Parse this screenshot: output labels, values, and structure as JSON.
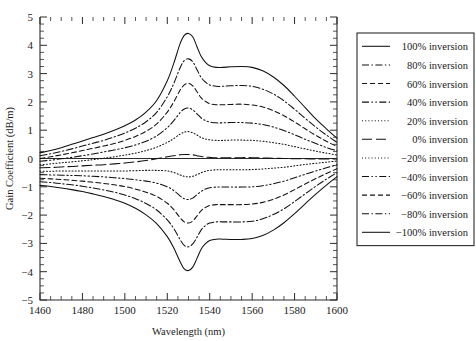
{
  "chart_data": {
    "type": "line",
    "title": "",
    "xlabel": "Wavelength (nm)",
    "ylabel": "Gain Coefficient (dB/m)",
    "xlim": [
      1460,
      1600
    ],
    "ylim": [
      -5,
      5
    ],
    "xticks": [
      1460,
      1480,
      1500,
      1520,
      1540,
      1560,
      1580,
      1600
    ],
    "xtick_labels": [
      "1460",
      "1480",
      "1500",
      "1520",
      "1540",
      "1560",
      "1580",
      "1600"
    ],
    "yticks": [
      -5,
      -4,
      -3,
      -2,
      -1,
      0,
      1,
      2,
      3,
      4,
      5
    ],
    "ytick_labels": [
      "−5",
      "−4",
      "−3",
      "−2",
      "−1",
      "0",
      "1",
      "2",
      "3",
      "4",
      "5"
    ],
    "x_minor_tick_step": 5,
    "y_minor_tick_step": 0.25,
    "grid": false,
    "legend_position": "right-outside",
    "zero_reference_line": true,
    "x": [
      1460,
      1465,
      1470,
      1475,
      1480,
      1485,
      1490,
      1495,
      1500,
      1505,
      1510,
      1515,
      1520,
      1523,
      1526,
      1528,
      1530,
      1532,
      1534,
      1536,
      1538,
      1540,
      1543,
      1546,
      1550,
      1555,
      1560,
      1565,
      1570,
      1575,
      1580,
      1585,
      1590,
      1595,
      1600
    ],
    "series": [
      {
        "name": "100% inversion",
        "inversion_percent": 100,
        "style": "solid",
        "values": [
          0.2,
          0.28,
          0.38,
          0.5,
          0.62,
          0.74,
          0.86,
          1.0,
          1.16,
          1.36,
          1.64,
          2.05,
          2.75,
          3.35,
          4.05,
          4.35,
          4.42,
          4.3,
          3.95,
          3.6,
          3.4,
          3.28,
          3.22,
          3.22,
          3.24,
          3.25,
          3.22,
          3.1,
          2.88,
          2.58,
          2.2,
          1.8,
          1.4,
          1.05,
          0.72
        ]
      },
      {
        "name": "80% inversion",
        "inversion_percent": 80,
        "style": "dash-dot",
        "values": [
          0.1,
          0.17,
          0.25,
          0.34,
          0.44,
          0.54,
          0.64,
          0.76,
          0.9,
          1.07,
          1.3,
          1.63,
          2.18,
          2.64,
          3.2,
          3.46,
          3.52,
          3.42,
          3.14,
          2.86,
          2.7,
          2.6,
          2.55,
          2.55,
          2.57,
          2.58,
          2.55,
          2.45,
          2.28,
          2.04,
          1.74,
          1.42,
          1.11,
          0.83,
          0.57
        ]
      },
      {
        "name": "60% inversion",
        "inversion_percent": 60,
        "style": "dashed",
        "values": [
          0.0,
          0.06,
          0.13,
          0.2,
          0.28,
          0.36,
          0.44,
          0.53,
          0.64,
          0.78,
          0.96,
          1.22,
          1.64,
          1.99,
          2.41,
          2.6,
          2.65,
          2.57,
          2.36,
          2.14,
          2.02,
          1.94,
          1.9,
          1.9,
          1.91,
          1.92,
          1.89,
          1.82,
          1.69,
          1.51,
          1.29,
          1.05,
          0.82,
          0.61,
          0.42
        ]
      },
      {
        "name": "40% inversion",
        "inversion_percent": 40,
        "style": "dash-dot-dot",
        "values": [
          -0.1,
          -0.06,
          -0.01,
          0.04,
          0.1,
          0.16,
          0.23,
          0.3,
          0.38,
          0.48,
          0.61,
          0.8,
          1.09,
          1.33,
          1.62,
          1.75,
          1.78,
          1.72,
          1.58,
          1.43,
          1.34,
          1.29,
          1.26,
          1.26,
          1.27,
          1.27,
          1.25,
          1.2,
          1.11,
          0.99,
          0.84,
          0.68,
          0.53,
          0.39,
          0.27
        ]
      },
      {
        "name": "20% inversion",
        "inversion_percent": 20,
        "style": "dotted",
        "values": [
          -0.22,
          -0.19,
          -0.15,
          -0.12,
          -0.08,
          -0.04,
          0.01,
          0.06,
          0.12,
          0.19,
          0.28,
          0.4,
          0.57,
          0.7,
          0.86,
          0.93,
          0.95,
          0.91,
          0.83,
          0.74,
          0.69,
          0.66,
          0.64,
          0.64,
          0.65,
          0.65,
          0.64,
          0.61,
          0.56,
          0.5,
          0.42,
          0.34,
          0.26,
          0.19,
          0.12
        ]
      },
      {
        "name": "0% inversion",
        "inversion_percent": 0,
        "style": "long-dash",
        "values": [
          -0.33,
          -0.32,
          -0.3,
          -0.28,
          -0.26,
          -0.24,
          -0.22,
          -0.19,
          -0.16,
          -0.12,
          -0.07,
          -0.01,
          0.06,
          0.1,
          0.13,
          0.14,
          0.14,
          0.13,
          0.1,
          0.07,
          0.05,
          0.04,
          0.03,
          0.03,
          0.03,
          0.03,
          0.03,
          0.02,
          0.01,
          0.0,
          -0.01,
          -0.01,
          -0.02,
          -0.02,
          -0.02
        ]
      },
      {
        "name": "−20% inversion",
        "inversion_percent": -20,
        "style": "dotted",
        "values": [
          -0.45,
          -0.45,
          -0.44,
          -0.44,
          -0.44,
          -0.44,
          -0.44,
          -0.44,
          -0.44,
          -0.43,
          -0.42,
          -0.42,
          -0.44,
          -0.49,
          -0.58,
          -0.63,
          -0.65,
          -0.63,
          -0.57,
          -0.5,
          -0.45,
          -0.42,
          -0.4,
          -0.4,
          -0.4,
          -0.4,
          -0.39,
          -0.37,
          -0.34,
          -0.31,
          -0.26,
          -0.21,
          -0.17,
          -0.13,
          -0.09
        ]
      },
      {
        "name": "−40% inversion",
        "inversion_percent": -40,
        "style": "dash-dot-dot",
        "values": [
          -0.57,
          -0.58,
          -0.59,
          -0.6,
          -0.61,
          -0.63,
          -0.65,
          -0.68,
          -0.71,
          -0.75,
          -0.8,
          -0.87,
          -1.0,
          -1.13,
          -1.32,
          -1.42,
          -1.45,
          -1.4,
          -1.28,
          -1.16,
          -1.08,
          -1.03,
          -1.01,
          -1.01,
          -1.01,
          -1.01,
          -1.0,
          -0.96,
          -0.89,
          -0.8,
          -0.68,
          -0.56,
          -0.44,
          -0.33,
          -0.22
        ]
      },
      {
        "name": "−60% inversion",
        "inversion_percent": -60,
        "style": "dashed",
        "values": [
          -0.7,
          -0.72,
          -0.74,
          -0.77,
          -0.8,
          -0.84,
          -0.88,
          -0.93,
          -0.99,
          -1.08,
          -1.19,
          -1.34,
          -1.58,
          -1.8,
          -2.09,
          -2.24,
          -2.28,
          -2.21,
          -2.03,
          -1.84,
          -1.73,
          -1.66,
          -1.63,
          -1.63,
          -1.63,
          -1.63,
          -1.61,
          -1.55,
          -1.44,
          -1.29,
          -1.1,
          -0.9,
          -0.71,
          -0.53,
          -0.36
        ]
      },
      {
        "name": "−80% inversion",
        "inversion_percent": -80,
        "style": "dash-dot",
        "values": [
          -0.82,
          -0.85,
          -0.89,
          -0.93,
          -0.98,
          -1.04,
          -1.11,
          -1.19,
          -1.29,
          -1.42,
          -1.59,
          -1.82,
          -2.17,
          -2.47,
          -2.86,
          -3.07,
          -3.12,
          -3.02,
          -2.78,
          -2.52,
          -2.37,
          -2.28,
          -2.24,
          -2.24,
          -2.24,
          -2.24,
          -2.22,
          -2.13,
          -1.98,
          -1.78,
          -1.52,
          -1.25,
          -0.98,
          -0.73,
          -0.5
        ]
      },
      {
        "name": "−100% inversion",
        "inversion_percent": -100,
        "style": "solid",
        "values": [
          -0.95,
          -0.99,
          -1.04,
          -1.1,
          -1.17,
          -1.25,
          -1.34,
          -1.45,
          -1.58,
          -1.76,
          -1.99,
          -2.3,
          -2.76,
          -3.15,
          -3.64,
          -3.9,
          -3.96,
          -3.84,
          -3.53,
          -3.2,
          -3.01,
          -2.9,
          -2.85,
          -2.85,
          -2.86,
          -2.86,
          -2.83,
          -2.72,
          -2.53,
          -2.27,
          -1.95,
          -1.6,
          -1.26,
          -0.94,
          -0.64
        ]
      }
    ],
    "legend_entries": [
      {
        "label": "100% inversion",
        "style": "solid"
      },
      {
        "label": "80% inversion",
        "style": "dash-dot"
      },
      {
        "label": "60% inversion",
        "style": "dashed"
      },
      {
        "label": "40% inversion",
        "style": "dash-dot-dot"
      },
      {
        "label": "20% inversion",
        "style": "dotted"
      },
      {
        "label": "0% inversion",
        "style": "long-dash"
      },
      {
        "label": "−20% inversion",
        "style": "dotted"
      },
      {
        "label": "−40% inversion",
        "style": "dash-dot-dot"
      },
      {
        "label": "−60% inversion",
        "style": "dashed"
      },
      {
        "label": "−80% inversion",
        "style": "dash-dot"
      },
      {
        "label": "−100% inversion",
        "style": "solid"
      }
    ]
  }
}
